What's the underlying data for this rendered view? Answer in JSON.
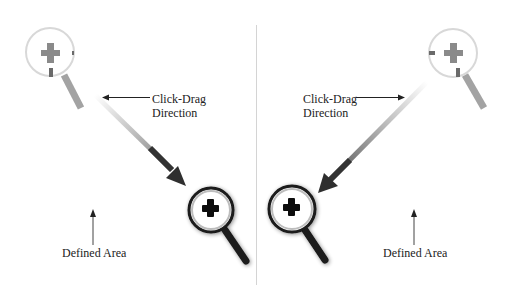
{
  "diagram": {
    "colors": {
      "background": "#ffffff",
      "divider": "#d4d4d4",
      "start_magnifier": "#9a9a9a",
      "end_magnifier": "#1a1a1a",
      "drag_arrow": "#3a3a3a",
      "pointer_arrow": "#222222"
    },
    "panels": [
      {
        "id": "left",
        "direction": "top-left to bottom-right",
        "drag_label_line1": "Click-Drag",
        "drag_label_line2": "Direction",
        "area_label": "Defined Area",
        "start_icon": "zoom-in-magnifier-faded",
        "end_icon": "zoom-in-magnifier"
      },
      {
        "id": "right",
        "direction": "top-right to bottom-left",
        "drag_label_line1": "Click-Drag",
        "drag_label_line2": "Direction",
        "area_label": "Defined Area",
        "start_icon": "zoom-in-magnifier-faded",
        "end_icon": "zoom-in-magnifier"
      }
    ]
  }
}
